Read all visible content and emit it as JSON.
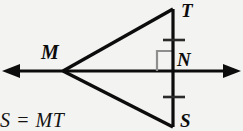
{
  "figure": {
    "name": "isosceles-triangle-perpendicular-bisector",
    "background_color": "#f3f3f1",
    "stroke_color": "#0c0c0c",
    "right_angle_color": "#8e8e8e",
    "labels": {
      "apex_left": "M",
      "top_vertex": "T",
      "foot_point": "N",
      "bottom_vertex": "S"
    },
    "caption": "S = MT",
    "elements": {
      "horizontal_line_name": "double-headed-horizontal-line",
      "vertical_segment_name": "segment-TS",
      "upper_side_name": "segment-MT",
      "lower_side_name": "segment-MS",
      "right_angle_name": "right-angle-mark",
      "tick_upper_name": "congruence-tick-TN",
      "tick_lower_name": "congruence-tick-NS"
    }
  }
}
